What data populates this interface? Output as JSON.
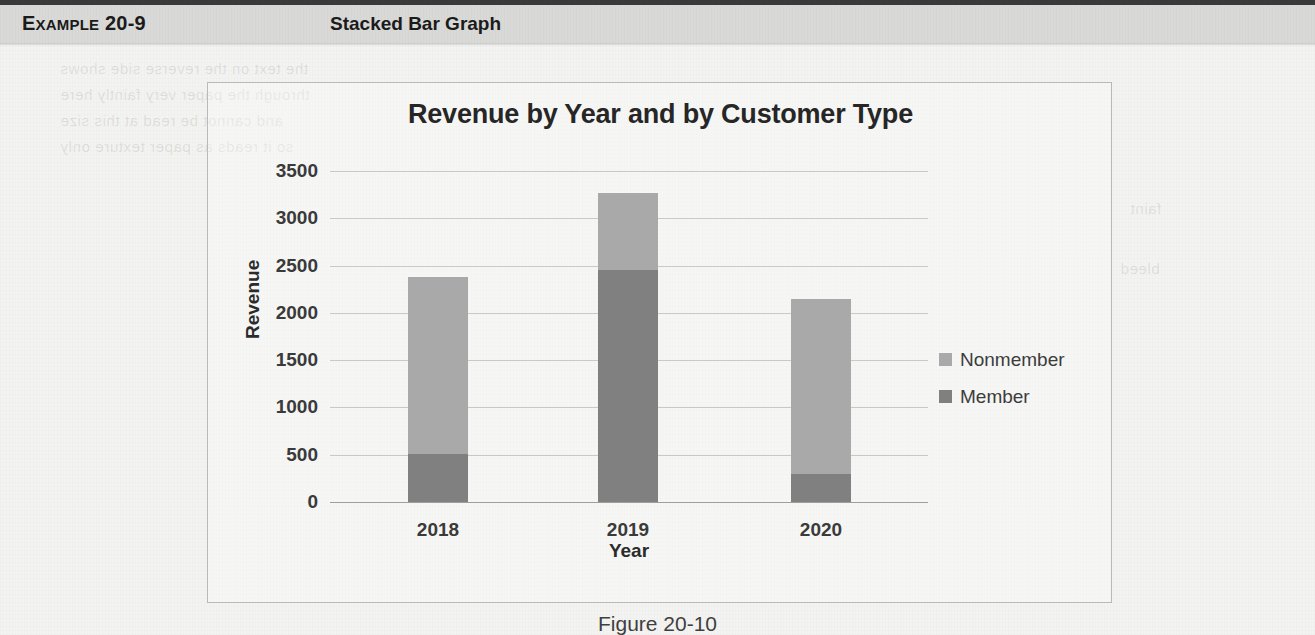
{
  "header": {
    "example_label_small": "XAMPLE",
    "example_label_first": "E",
    "example_number": " 20-9",
    "example_title": "Stacked Bar Graph"
  },
  "figure": {
    "caption": "Figure 20-10"
  },
  "legend": {
    "items": [
      {
        "label": "Nonmember",
        "color": "#a9a9a9"
      },
      {
        "label": "Member",
        "color": "#808080"
      }
    ]
  },
  "chart_data": {
    "type": "bar",
    "stacked": true,
    "title": "Revenue by Year and by Customer Type",
    "xlabel": "Year",
    "ylabel": "Revenue",
    "categories": [
      "2018",
      "2019",
      "2020"
    ],
    "ylim": [
      0,
      3500
    ],
    "yticks": [
      "0",
      "500",
      "1000",
      "1500",
      "2000",
      "2500",
      "3000",
      "3500"
    ],
    "ytick_values": [
      0,
      500,
      1000,
      1500,
      2000,
      2500,
      3000,
      3500
    ],
    "grid": true,
    "legend_position": "right",
    "series": [
      {
        "name": "Member",
        "color": "#808080",
        "values": [
          510,
          2450,
          300
        ]
      },
      {
        "name": "Nonmember",
        "color": "#a9a9a9",
        "values": [
          1865,
          820,
          1850
        ]
      }
    ],
    "totals": [
      2375,
      3270,
      2150
    ]
  },
  "background_ghost_text": [
    "previous page show-through",
    "reverse side printing",
    "faint bleed text"
  ]
}
